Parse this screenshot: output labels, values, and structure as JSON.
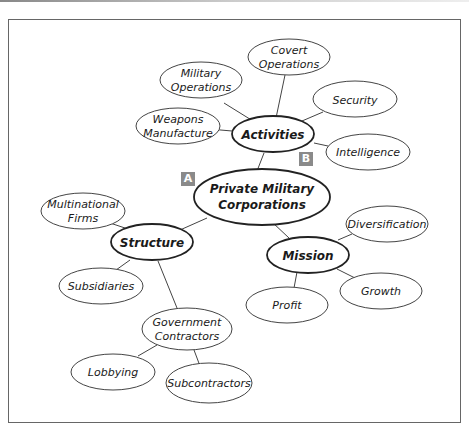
{
  "diagram": {
    "type": "concept-map",
    "central": {
      "id": "pmc",
      "lines": [
        "Private Military",
        "Corporations"
      ]
    },
    "hubs": [
      {
        "id": "activities",
        "label": "Activities"
      },
      {
        "id": "structure",
        "label": "Structure"
      },
      {
        "id": "mission",
        "label": "Mission"
      }
    ],
    "leaves": {
      "military_operations": [
        "Military",
        "Operations"
      ],
      "covert_operations": [
        "Covert",
        "Operations"
      ],
      "security": [
        "Security"
      ],
      "weapons_manufacture": [
        "Weapons",
        "Manufacture"
      ],
      "intelligence": [
        "Intelligence"
      ],
      "multinational_firms": [
        "Multinational",
        "Firms"
      ],
      "subsidiaries": [
        "Subsidiaries"
      ],
      "government_contractors": [
        "Government",
        "Contractors"
      ],
      "lobbying": [
        "Lobbying"
      ],
      "subcontractors": [
        "Subcontractors"
      ],
      "diversification": [
        "Diversification"
      ],
      "growth": [
        "Growth"
      ],
      "profit": [
        "Profit"
      ]
    },
    "tags": {
      "a": "A",
      "b": "B"
    },
    "edges": [
      [
        "pmc",
        "activities"
      ],
      [
        "pmc",
        "structure"
      ],
      [
        "pmc",
        "mission"
      ],
      [
        "activities",
        "military_operations"
      ],
      [
        "activities",
        "covert_operations"
      ],
      [
        "activities",
        "security"
      ],
      [
        "activities",
        "weapons_manufacture"
      ],
      [
        "activities",
        "intelligence"
      ],
      [
        "structure",
        "multinational_firms"
      ],
      [
        "structure",
        "subsidiaries"
      ],
      [
        "structure",
        "government_contractors"
      ],
      [
        "government_contractors",
        "lobbying"
      ],
      [
        "government_contractors",
        "subcontractors"
      ],
      [
        "mission",
        "diversification"
      ],
      [
        "mission",
        "growth"
      ],
      [
        "mission",
        "profit"
      ]
    ]
  }
}
